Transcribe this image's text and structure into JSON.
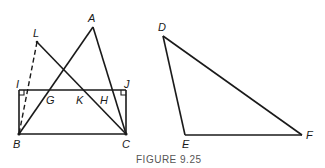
{
  "figure": {
    "caption": "FIGURE 9.25",
    "colors": {
      "stroke": "#1a1a1a",
      "caption": "#555555",
      "background": "#ffffff"
    }
  },
  "left_figure": {
    "points": {
      "A": {
        "label": "A",
        "x": 93,
        "y": 27
      },
      "L": {
        "label": "L",
        "x": 37,
        "y": 42
      },
      "I": {
        "label": "I",
        "x": 19,
        "y": 90
      },
      "J": {
        "label": "J",
        "x": 126,
        "y": 90
      },
      "G": {
        "label": "G",
        "x": 50,
        "y": 90
      },
      "K": {
        "label": "K",
        "x": 85,
        "y": 90
      },
      "H": {
        "label": "H",
        "x": 113,
        "y": 90
      },
      "B": {
        "label": "B",
        "x": 19,
        "y": 134
      },
      "C": {
        "label": "C",
        "x": 126,
        "y": 134
      }
    },
    "segments": [
      "AB",
      "AC",
      "LC",
      "BC",
      "IJ",
      "IB",
      "JC"
    ],
    "dashed_segments": [
      "LB"
    ],
    "right_angles": [
      "I",
      "J"
    ]
  },
  "right_figure": {
    "points": {
      "D": {
        "label": "D",
        "x": 163,
        "y": 36
      },
      "E": {
        "label": "E",
        "x": 185,
        "y": 135
      },
      "F": {
        "label": "F",
        "x": 302,
        "y": 135
      }
    },
    "segments": [
      "DE",
      "EF",
      "DF"
    ]
  }
}
